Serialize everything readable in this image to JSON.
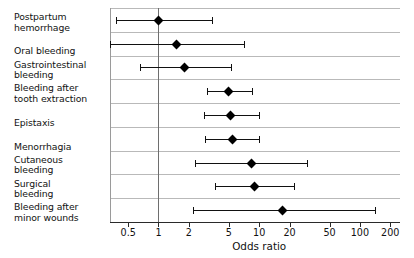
{
  "chart_data": {
    "type": "scatter",
    "subtype": "forest-plot",
    "title": "",
    "xlabel": "Odds ratio",
    "ylabel": "",
    "xscale": "log",
    "xlim": [
      0.33,
      250
    ],
    "grid": true,
    "legend": null,
    "reference_line": 1,
    "xticks": [
      0.5,
      1,
      2,
      5,
      10,
      20,
      50,
      100,
      200
    ],
    "xticklabels": [
      "0.5",
      "1",
      "2",
      "5",
      "10",
      "20",
      "50",
      "100",
      "200"
    ],
    "categories": [
      "Postpartum hemorrhage",
      "Oral bleeding",
      "Gastrointestinal bleeding",
      "Bleeding after tooth extraction",
      "Epistaxis",
      "Menorrhagia",
      "Cutaneous bleeding",
      "Surgical bleeding",
      "Bleeding after minor wounds"
    ],
    "points": [
      {
        "label": "Postpartum hemorrhage",
        "or": 1.0,
        "lo": 0.38,
        "hi": 3.4
      },
      {
        "label": "Oral bleeding",
        "or": 1.5,
        "lo": 0.33,
        "hi": 7.0
      },
      {
        "label": "Gastrointestinal bleeding",
        "or": 1.8,
        "lo": 0.65,
        "hi": 5.2
      },
      {
        "label": "Bleeding after tooth extraction",
        "or": 5.0,
        "lo": 3.0,
        "hi": 8.5
      },
      {
        "label": "Epistaxis",
        "or": 5.2,
        "lo": 2.8,
        "hi": 10.0
      },
      {
        "label": "Menorrhagia",
        "or": 5.4,
        "lo": 2.9,
        "hi": 10.0
      },
      {
        "label": "Cutaneous bleeding",
        "or": 8.4,
        "lo": 2.3,
        "hi": 30.0
      },
      {
        "label": "Surgical bleeding",
        "or": 9.0,
        "lo": 3.6,
        "hi": 22.0
      },
      {
        "label": "Bleeding after minor wounds",
        "or": 17.0,
        "lo": 2.2,
        "hi": 140.0
      }
    ]
  },
  "labels": {
    "rows": [
      "Postpartum\nhemorrhage",
      "Oral bleeding",
      "Gastrointestinal\nbleeding",
      "Bleeding after\ntooth extraction",
      "Epistaxis",
      "Menorrhagia",
      "Cutaneous\nbleeding",
      "Surgical\nbleeding",
      "Bleeding after\nminor wounds"
    ]
  },
  "style": {
    "marker_color": "#000000",
    "line_color": "#111111",
    "grid_color": "#b9b9b9",
    "axis_color": "#2a2a2a",
    "reference_color": "#6e6e6e",
    "background": "#ffffff"
  }
}
